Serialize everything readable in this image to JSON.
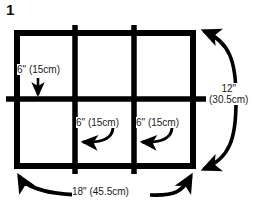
{
  "figure": {
    "number": "1",
    "type": "dimensioned-grid-diagram",
    "stroke_color": "#000000",
    "text_color": "#1a1a1a",
    "background_color": "#ffffff"
  },
  "grid": {
    "columns": 3,
    "rows": 2,
    "cell_width_label": "6\" (15cm)",
    "cell_height_label": "6\" (15cm)"
  },
  "labels": {
    "cell_left": "6\" (15cm)",
    "cell_middle": "6\" (15cm)",
    "cell_right": "6\" (15cm)",
    "height_line1": "12\"",
    "height_line2": "(30.5cm)",
    "width": "18\" (45.5cm)"
  },
  "annotations": {
    "down_arrow": "arrow-down-icon",
    "left_arrow_middle": "curved-arrow-left-icon",
    "left_arrow_right": "curved-arrow-left-icon",
    "height_dimension": "curved-double-arrow-vertical-icon",
    "width_dimension": "curved-double-arrow-horizontal-icon"
  }
}
